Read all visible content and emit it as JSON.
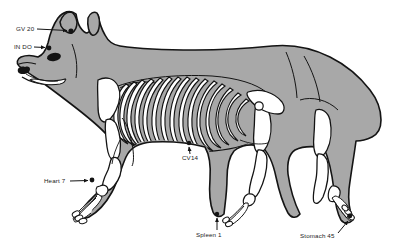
{
  "figure": {
    "background_color": "#ffffff",
    "body_fill_color": "#a8a8a8",
    "bone_fill_color": "#ffffff",
    "outline_color": "#1a1a1a",
    "label_color": "#1a1a1a"
  },
  "annotations": [
    {
      "id": "gv20",
      "label": "GV 20",
      "region": "top of head between the ears",
      "point_x": 71,
      "point_y": 31,
      "label_x": 16,
      "label_y": 25.5
    },
    {
      "id": "indo",
      "label": "IN DO",
      "region": "forehead above the eye",
      "point_x": 49,
      "point_y": 48,
      "label_x": 14,
      "label_y": 43.5
    },
    {
      "id": "cv14",
      "label": "CV14",
      "region": "caudal sternum of the thorax",
      "point_x": 189,
      "point_y": 143,
      "label_x": 182,
      "label_y": 155
    },
    {
      "id": "heart7",
      "label": "Heart 7",
      "region": "medial carpus of the forelimb",
      "point_x": 89,
      "point_y": 182,
      "label_x": 44,
      "label_y": 178
    },
    {
      "id": "spleen1",
      "label": "Spleen 1",
      "region": "medial digit of the hind paw",
      "point_x": 216,
      "point_y": 215,
      "label_x": 196,
      "label_y": 232
    },
    {
      "id": "stomach45",
      "label": "Stomach 45",
      "region": "lateral digit of the rear paw",
      "point_x": 349,
      "point_y": 218,
      "label_x": 300,
      "label_y": 233
    }
  ]
}
